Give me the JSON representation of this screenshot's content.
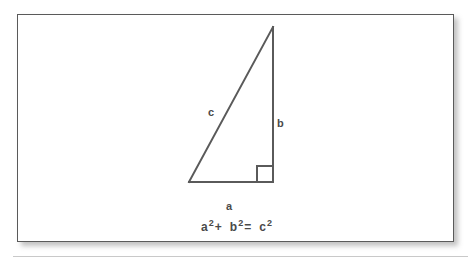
{
  "figure": {
    "name": "pythagorean-theorem-diagram",
    "card": {
      "background_color": "#ffffff",
      "border_color": "#5a5a5a"
    },
    "stroke_color": "#5a5a5a",
    "text_color": "#4a4a4a",
    "triangle": {
      "description": "right triangle",
      "vertices": {
        "apex": [
          255,
          12
        ],
        "bottom_left": [
          171,
          167
        ],
        "bottom_right": [
          255,
          167
        ]
      },
      "right_angle_marker": {
        "size": 16,
        "corner": "bottom-right"
      }
    },
    "labels": {
      "hypotenuse": "c",
      "vertical_leg": "b",
      "horizontal_leg": "a"
    },
    "equation": {
      "term1_base": "a",
      "term1_exp": "2",
      "operator1": "+",
      "term2_base": "b",
      "term2_exp": "2",
      "operator2": "=",
      "term3_base": "c",
      "term3_exp": "2",
      "plain_text": "a2 + b2 = c2"
    }
  }
}
